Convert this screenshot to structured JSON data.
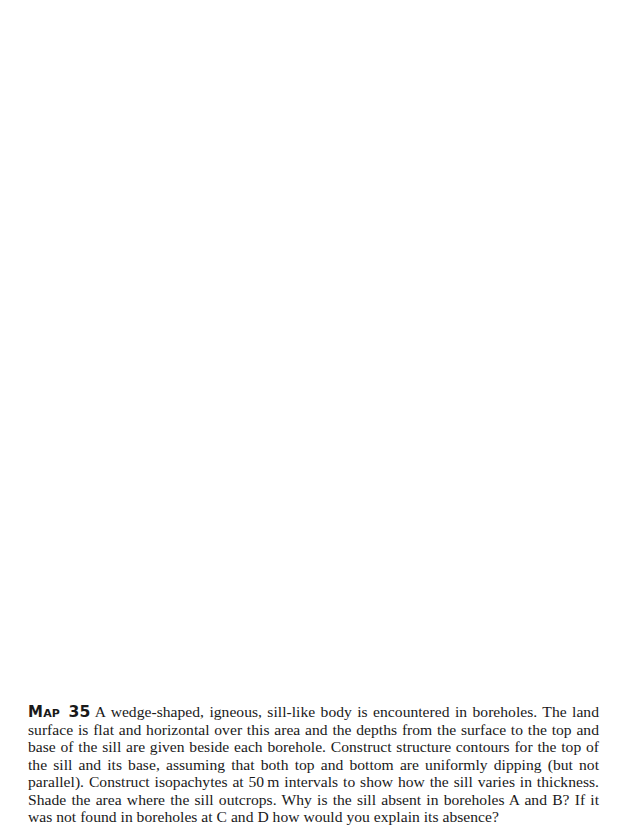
{
  "caption": {
    "label": "Map",
    "number": "35",
    "text": "A wedge-shaped, igneous, sill-like body is encountered in boreholes. The land surface is flat and horizontal over this area and the depths from the surface to the top and base of the sill are given beside each borehole. Construct structure contours for the top of the sill and its base, assuming that both top and bottom are uniformly dipping (but not parallel). Construct isopachytes at 50 m intervals to show how the sill varies in thickness. Shade the area where the sill outcrops. Why is the sill absent in boreholes A and B? If it was not found in boreholes at C and D how would you explain its absence?"
  }
}
